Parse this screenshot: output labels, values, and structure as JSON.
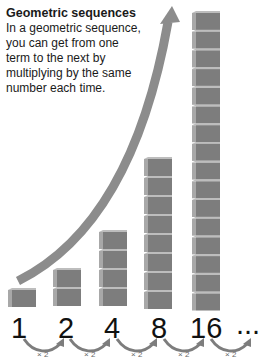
{
  "heading": {
    "title": "Geometric sequences",
    "description": "In a geometric sequence, you can get from one term to the next by multiplying by the same number each time."
  },
  "sequence": {
    "terms": [
      "1",
      "2",
      "4",
      "8",
      "16",
      "..."
    ],
    "multipliers": [
      "× 2",
      "× 2",
      "× 2",
      "× 2",
      "× 2"
    ]
  },
  "colors": {
    "cube_front": "#7a7a7a",
    "cube_side": "#a6a6a6",
    "cube_top": "#b8b8b8",
    "arrow": "#8c8c8c",
    "text": "#1a1a1a"
  }
}
